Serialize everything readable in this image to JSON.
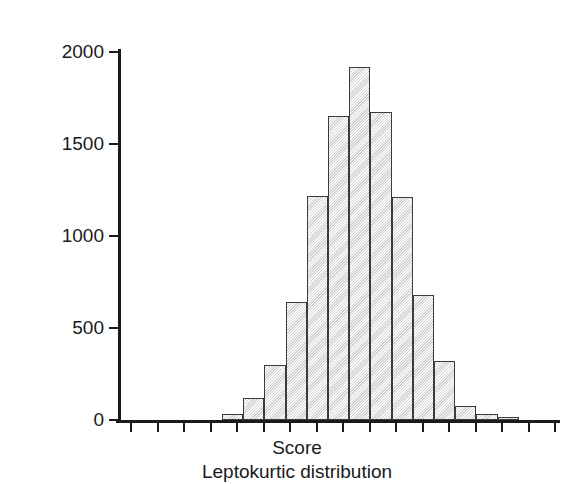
{
  "chart_data": {
    "type": "bar",
    "title": "Leptokurtic distribution",
    "xlabel": "Score",
    "ylabel": "Frequency",
    "grid": false,
    "legend": null,
    "ylim": [
      0,
      2000
    ],
    "ytick_labels": [
      "2000",
      "1500",
      "1000",
      "500",
      "0"
    ],
    "ytick_values": [
      2000,
      1500,
      1000,
      500,
      0
    ],
    "xtick_labels": [],
    "n_xticks": 17,
    "bin_index": [
      1,
      2,
      3,
      4,
      5,
      6,
      7,
      8,
      9,
      10,
      11,
      12,
      13,
      14
    ],
    "values": [
      30,
      120,
      300,
      640,
      1220,
      1650,
      1920,
      1675,
      1210,
      680,
      320,
      75,
      30,
      15
    ],
    "bar_fill_color": "#e4e4e4",
    "bar_edge_color": "#3c3c3c",
    "axis_color": "#1a1a1a",
    "background_color": "#ffffff"
  },
  "figure": {
    "ylabel": "Frequency",
    "xlabel": "Score",
    "caption": "Leptokurtic distribution"
  }
}
